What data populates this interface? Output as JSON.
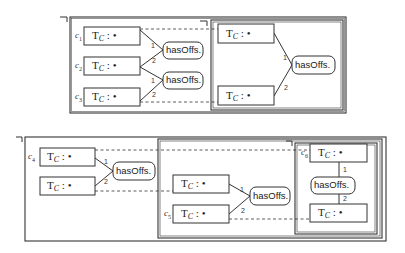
{
  "diagram": {
    "concept_label": {
      "top": "T",
      "sub": "C",
      "rest": " : •"
    },
    "relation_label": "hasOffs.",
    "edge_labels": {
      "first": "1",
      "second": "2"
    },
    "top": {
      "concept_ids": [
        "c1",
        "c2",
        "c3"
      ],
      "concepts_left": [
        {
          "id": "c1",
          "label": "T_C : •"
        },
        {
          "id": "c2",
          "label": "T_C : •"
        },
        {
          "id": "c3",
          "label": "T_C : •"
        }
      ],
      "relations_left": [
        "hasOffs.",
        "hasOffs."
      ],
      "concepts_right": [
        {
          "label": "T_C : •"
        },
        {
          "label": "T_C : •"
        }
      ],
      "relations_right": [
        "hasOffs."
      ]
    },
    "bottom": {
      "concept_ids": [
        "c4",
        "c5",
        "c6"
      ],
      "outer": {
        "concepts": [
          "T_C : •",
          "T_C : •"
        ],
        "relation": "hasOffs."
      },
      "middle": {
        "concepts": [
          "T_C : •",
          "T_C : •"
        ],
        "relation": "hasOffs."
      },
      "inner": {
        "concepts": [
          "T_C : •",
          "T_C : •"
        ],
        "relation": "hasOffs."
      }
    }
  },
  "labels": {
    "c1": "c1",
    "c2": "c2",
    "c3": "c3",
    "c4": "c4",
    "c5": "c5",
    "c6": "c6",
    "sub1": "1",
    "sub2": "2",
    "sub3": "3",
    "sub4": "4",
    "sub5": "5",
    "sub6": "6",
    "cbase": "c",
    "T": "T",
    "C": "C",
    "colon_dot": ": •",
    "has": "hasOffs.",
    "one": "1",
    "two": "2"
  }
}
